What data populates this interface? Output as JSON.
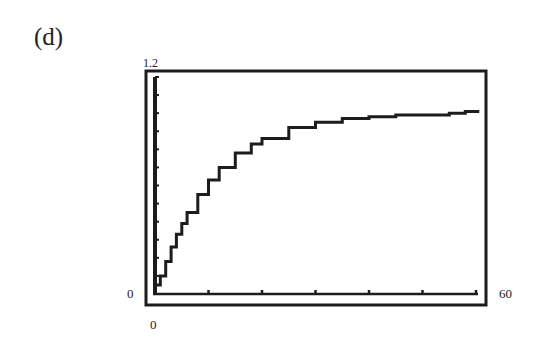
{
  "panel": {
    "label": "(d)"
  },
  "chart_data": {
    "type": "line",
    "title": "",
    "panel_label": "(d)",
    "xlabel": "",
    "ylabel": "",
    "xlim": [
      0,
      60
    ],
    "ylim": [
      0,
      1.2
    ],
    "axis_labels": {
      "y_max": "1.2",
      "y_min": "0",
      "x_min": "0",
      "x_max": "60"
    },
    "x_ticks": [
      0,
      10,
      20,
      30,
      40,
      50,
      60
    ],
    "y_tick_count": 12,
    "grid": false,
    "legend": null,
    "style": "calculator screen (pixelated step curve)",
    "series": [
      {
        "name": "y = 1 - e^(-t/10)",
        "x": [
          0,
          1,
          2,
          3,
          4,
          5,
          6,
          8,
          10,
          12,
          15,
          18,
          20,
          25,
          30,
          35,
          40,
          45,
          50,
          55,
          58
        ],
        "values": [
          0.05,
          0.1,
          0.18,
          0.26,
          0.33,
          0.39,
          0.45,
          0.55,
          0.63,
          0.7,
          0.78,
          0.83,
          0.86,
          0.92,
          0.95,
          0.97,
          0.98,
          0.99,
          0.99,
          1.0,
          1.01
        ]
      }
    ]
  }
}
